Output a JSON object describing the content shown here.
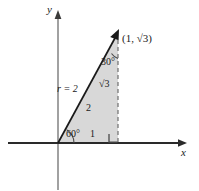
{
  "figure": {
    "type": "geometry-diagram",
    "background_color": "#ffffff",
    "fill_color": "#d8d8d8",
    "line_color": "#1a1a1a",
    "axes": {
      "x_axis_label": "x",
      "y_axis_label": "y",
      "origin": {
        "x": 58,
        "y": 143
      },
      "x_axis_tip": {
        "x": 186,
        "y": 143
      },
      "y_axis_tip": {
        "x": 58,
        "y": 12
      }
    },
    "ray": {
      "name": "terminal-ray",
      "from": {
        "x": 58,
        "y": 143
      },
      "to": {
        "x": 119,
        "y": 31
      },
      "arrow": true
    },
    "point": {
      "label": "(1, √3)",
      "x_value": 1,
      "y_value": "√3",
      "position": {
        "x": 121,
        "y": 41
      }
    },
    "labels": {
      "radius_outside": "r = 2",
      "hypotenuse_inside": "2",
      "opposite_side": "√3",
      "adjacent_side": "1",
      "angle_at_origin": "60°",
      "angle_at_top": "30°"
    },
    "angles": {
      "theta_degrees": 60,
      "complement_degrees": 30,
      "right_angle_degrees": 90
    },
    "triangle": {
      "vertices": [
        {
          "name": "origin",
          "x": 58,
          "y": 143
        },
        {
          "name": "foot",
          "x": 118,
          "y": 143
        },
        {
          "name": "apex",
          "x": 118,
          "y": 33
        }
      ],
      "sides": {
        "adjacent": 1,
        "opposite": "√3",
        "hypotenuse": 2
      }
    },
    "dashed_line": {
      "name": "vertical-drop",
      "from": {
        "x": 118,
        "y": 38
      },
      "to": {
        "x": 118,
        "y": 143
      }
    },
    "right_angle_marker": {
      "x": 109,
      "y": 133,
      "size": 9
    }
  }
}
